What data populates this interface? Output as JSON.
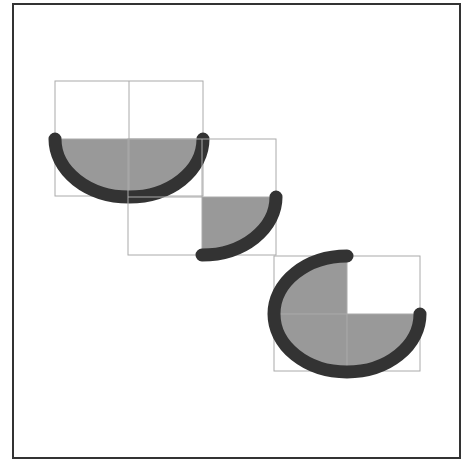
{
  "diagram": {
    "type": "elliptical arcs / pie segments",
    "frame": {
      "x": 13,
      "y": 4,
      "width": 447,
      "height": 454,
      "stroke": "#333333"
    },
    "colors": {
      "box_stroke": "#aaaaaa",
      "fill": "#999999",
      "arc_stroke": "#333333",
      "background": "#ffffff"
    },
    "shapes": [
      {
        "name": "half-arc",
        "box": {
          "x": 55,
          "y": 81,
          "w": 148,
          "h": 115
        },
        "cx": 129,
        "cy": 139,
        "rx": 74,
        "ry": 58,
        "start_deg": 0,
        "end_deg": 180
      },
      {
        "name": "quarter-arc",
        "box": {
          "x": 128,
          "y": 139,
          "w": 148,
          "h": 116
        },
        "cx": 202,
        "cy": 197,
        "rx": 74,
        "ry": 58,
        "start_deg": 0,
        "end_deg": 90
      },
      {
        "name": "three-quarter-arc",
        "box": {
          "x": 274,
          "y": 256,
          "w": 146,
          "h": 115
        },
        "cx": 347,
        "cy": 314,
        "rx": 73,
        "ry": 58,
        "start_deg": 0,
        "end_deg": 270
      }
    ]
  }
}
